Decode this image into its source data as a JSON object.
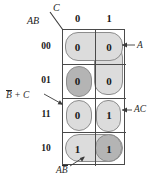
{
  "figure": {
    "type": "karnaugh-map",
    "variables": [
      "A",
      "B",
      "C"
    ],
    "column_variable_label": "C",
    "row_variable_label": "AB",
    "column_headers": [
      "0",
      "1"
    ],
    "row_headers": [
      "00",
      "01",
      "11",
      "10"
    ],
    "cells": [
      {
        "row": "00",
        "col": "0",
        "value": "0"
      },
      {
        "row": "00",
        "col": "1",
        "value": "0"
      },
      {
        "row": "01",
        "col": "0",
        "value": "0"
      },
      {
        "row": "01",
        "col": "1",
        "value": "0"
      },
      {
        "row": "11",
        "col": "0",
        "value": "0"
      },
      {
        "row": "11",
        "col": "1",
        "value": "1"
      },
      {
        "row": "10",
        "col": "0",
        "value": "1"
      },
      {
        "row": "10",
        "col": "1",
        "value": "1"
      }
    ],
    "groups": [
      {
        "name": "A",
        "label": "A",
        "overbar_on": "",
        "shade": "light",
        "cells": [
          "00/0",
          "00/1",
          "01/1"
        ]
      },
      {
        "name": "B-bar-C",
        "label_prefix": "B",
        "label_suffix": " + C",
        "overbar_on": "B",
        "shade": "dark-and-light",
        "cells": [
          "01/0",
          "11/0"
        ]
      },
      {
        "name": "AC",
        "label": "AC",
        "overbar_on": "",
        "shade": "light",
        "cells": [
          "11/1"
        ]
      },
      {
        "name": "A-B-bar",
        "label_prefix": "A",
        "label_suffix": "B",
        "overbar_on": "B",
        "shade": "light-and-dark",
        "cells": [
          "10/0",
          "10/1"
        ]
      }
    ],
    "annotations": {
      "top_right": "A",
      "middle_right": "AC",
      "left_prefix": "B",
      "left_suffix": " + C",
      "bottom_prefix": "A",
      "bottom_suffix": "B"
    },
    "colors": {
      "group_light": "#dcdcdc",
      "group_dark": "#b4b4b4",
      "grid_line": "#4a4a4a",
      "group_outline": "#8c8c8c",
      "text": "#1a1a1a",
      "background": "#ffffff"
    }
  }
}
